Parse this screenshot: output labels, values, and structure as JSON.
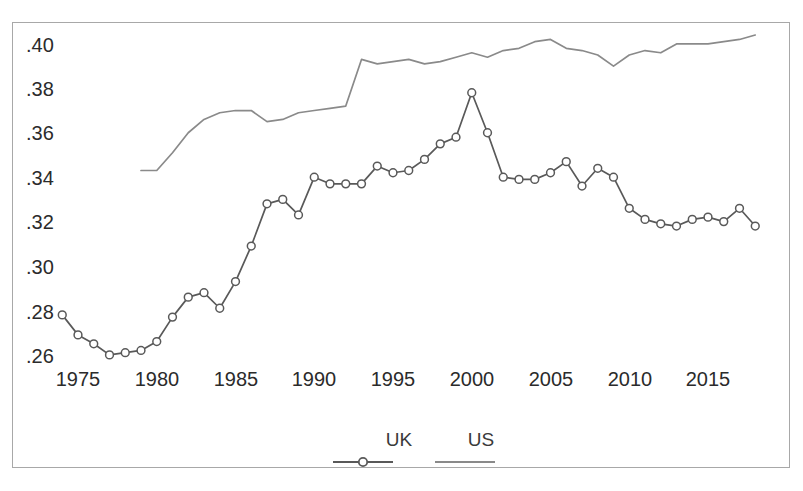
{
  "chart_data": {
    "type": "line",
    "title": "",
    "subtitle": "",
    "xlabel": "",
    "ylabel": "",
    "xlim": [
      1974,
      2018
    ],
    "ylim": [
      0.252,
      0.411
    ],
    "grid": false,
    "legend_position": "bottom-center",
    "xtick_labels": [
      "1975",
      "1980",
      "1985",
      "1990",
      "1995",
      "2000",
      "2005",
      "2010",
      "2015"
    ],
    "xtick_values": [
      1975,
      1980,
      1985,
      1990,
      1995,
      2000,
      2005,
      2010,
      2015
    ],
    "ytick_labels": [
      ".40",
      ".38",
      ".36",
      ".34",
      ".32",
      ".30",
      ".28",
      ".26"
    ],
    "ytick_values": [
      0.4,
      0.38,
      0.36,
      0.34,
      0.32,
      0.3,
      0.28,
      0.26
    ],
    "series": [
      {
        "name": "UK",
        "color": "#595959",
        "marker": "open-circle",
        "x": [
          1974,
          1975,
          1976,
          1977,
          1978,
          1979,
          1980,
          1981,
          1982,
          1983,
          1984,
          1985,
          1986,
          1987,
          1988,
          1989,
          1990,
          1991,
          1992,
          1993,
          1994,
          1995,
          1996,
          1997,
          1998,
          1999,
          2000,
          2001,
          2002,
          2003,
          2004,
          2005,
          2006,
          2007,
          2008,
          2009,
          2010,
          2011,
          2012,
          2013,
          2014,
          2015,
          2016,
          2017,
          2018
        ],
        "values": [
          0.2785,
          0.2695,
          0.2655,
          0.2605,
          0.2615,
          0.2625,
          0.2665,
          0.2775,
          0.2865,
          0.2885,
          0.2815,
          0.2935,
          0.3095,
          0.3285,
          0.3305,
          0.3235,
          0.3405,
          0.3375,
          0.3375,
          0.3375,
          0.3455,
          0.3425,
          0.3435,
          0.3485,
          0.3555,
          0.3585,
          0.3785,
          0.3605,
          0.3405,
          0.3395,
          0.3395,
          0.3425,
          0.3475,
          0.3365,
          0.3445,
          0.3405,
          0.3265,
          0.3215,
          0.3195,
          0.3185,
          0.3215,
          0.3225,
          0.3205,
          0.3265,
          0.3185
        ]
      },
      {
        "name": "US",
        "color": "#8a8a8a",
        "marker": "none",
        "x": [
          1979,
          1980,
          1981,
          1982,
          1983,
          1984,
          1985,
          1986,
          1987,
          1988,
          1989,
          1990,
          1991,
          1992,
          1993,
          1994,
          1995,
          1996,
          1997,
          1998,
          1999,
          2000,
          2001,
          2002,
          2003,
          2004,
          2005,
          2006,
          2007,
          2008,
          2009,
          2010,
          2011,
          2012,
          2013,
          2014,
          2015,
          2016,
          2017,
          2018
        ],
        "values": [
          0.3435,
          0.3435,
          0.3515,
          0.3605,
          0.3665,
          0.3695,
          0.3705,
          0.3705,
          0.3655,
          0.3665,
          0.3695,
          0.3705,
          0.3715,
          0.3725,
          0.3935,
          0.3915,
          0.3925,
          0.3935,
          0.3915,
          0.3925,
          0.3945,
          0.3965,
          0.3945,
          0.3975,
          0.3985,
          0.4015,
          0.4025,
          0.3985,
          0.3975,
          0.3955,
          0.3905,
          0.3955,
          0.3975,
          0.3965,
          0.4005,
          0.4005,
          0.4005,
          0.4015,
          0.4025,
          0.4045
        ]
      }
    ],
    "annotations": []
  },
  "legend": {
    "entries": [
      {
        "label": "UK",
        "marker": "line-with-open-circle",
        "color": "#595959"
      },
      {
        "label": "US",
        "marker": "line",
        "color": "#8a8a8a"
      }
    ]
  },
  "axis": {
    "y_labels": [
      ".40",
      ".38",
      ".36",
      ".34",
      ".32",
      ".30",
      ".28",
      ".26"
    ],
    "x_labels": [
      "1975",
      "1980",
      "1985",
      "1990",
      "1995",
      "2000",
      "2005",
      "2010",
      "2015"
    ]
  }
}
